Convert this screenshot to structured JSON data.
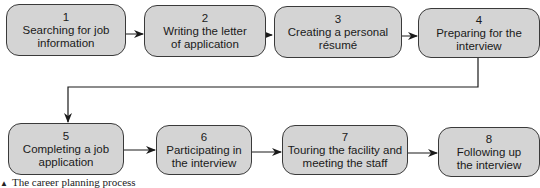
{
  "diagram": {
    "type": "flowchart",
    "steps": [
      {
        "number": "1",
        "label": "Searching for job\ninformation"
      },
      {
        "number": "2",
        "label": "Writing the letter\nof application"
      },
      {
        "number": "3",
        "label": "Creating a personal\nrésumé"
      },
      {
        "number": "4",
        "label": "Preparing for the\ninterview"
      },
      {
        "number": "5",
        "label": "Completing a job\napplication"
      },
      {
        "number": "6",
        "label": "Participating in\nthe interview"
      },
      {
        "number": "7",
        "label": "Touring the facility and\nmeeting the staff"
      },
      {
        "number": "8",
        "label": "Following up\nthe interview"
      }
    ],
    "edges": [
      [
        "1",
        "2"
      ],
      [
        "2",
        "3"
      ],
      [
        "3",
        "4"
      ],
      [
        "4",
        "5"
      ],
      [
        "5",
        "6"
      ],
      [
        "6",
        "7"
      ],
      [
        "7",
        "8"
      ]
    ],
    "colors": {
      "box_fill": "#d4d4d4",
      "box_border": "#3a3a3a",
      "arrow": "#1a1a1a"
    }
  },
  "caption": {
    "marker": "▲",
    "text": "The career planning process"
  }
}
